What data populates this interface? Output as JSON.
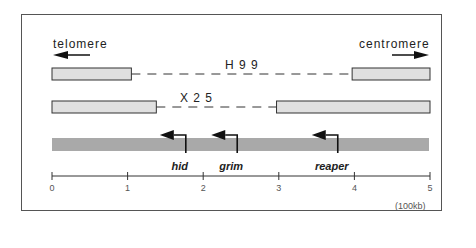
{
  "diagram": {
    "orientation": {
      "left_label": "telomere",
      "right_label": "centromere"
    },
    "deletions": [
      {
        "name": "H99",
        "label": "H 9 9",
        "retained_left_end": 1.05,
        "retained_right_start": 3.97
      },
      {
        "name": "X25",
        "label": "X 2 5",
        "retained_left_end": 1.38,
        "retained_right_start": 2.97
      }
    ],
    "genes": [
      {
        "name": "hid",
        "position": 1.77,
        "direction": "left"
      },
      {
        "name": "grim",
        "position": 2.45,
        "direction": "left"
      },
      {
        "name": "reaper",
        "position": 3.78,
        "direction": "left"
      }
    ],
    "scale": {
      "ticks": [
        "0",
        "1",
        "2",
        "3",
        "4",
        "5"
      ],
      "range": [
        0,
        5
      ],
      "unit_label": "(100kb)"
    },
    "colors": {
      "bar_fill": "#e0e0e0",
      "genomic_fill": "#a9a9a9",
      "stroke": "#333333"
    }
  }
}
